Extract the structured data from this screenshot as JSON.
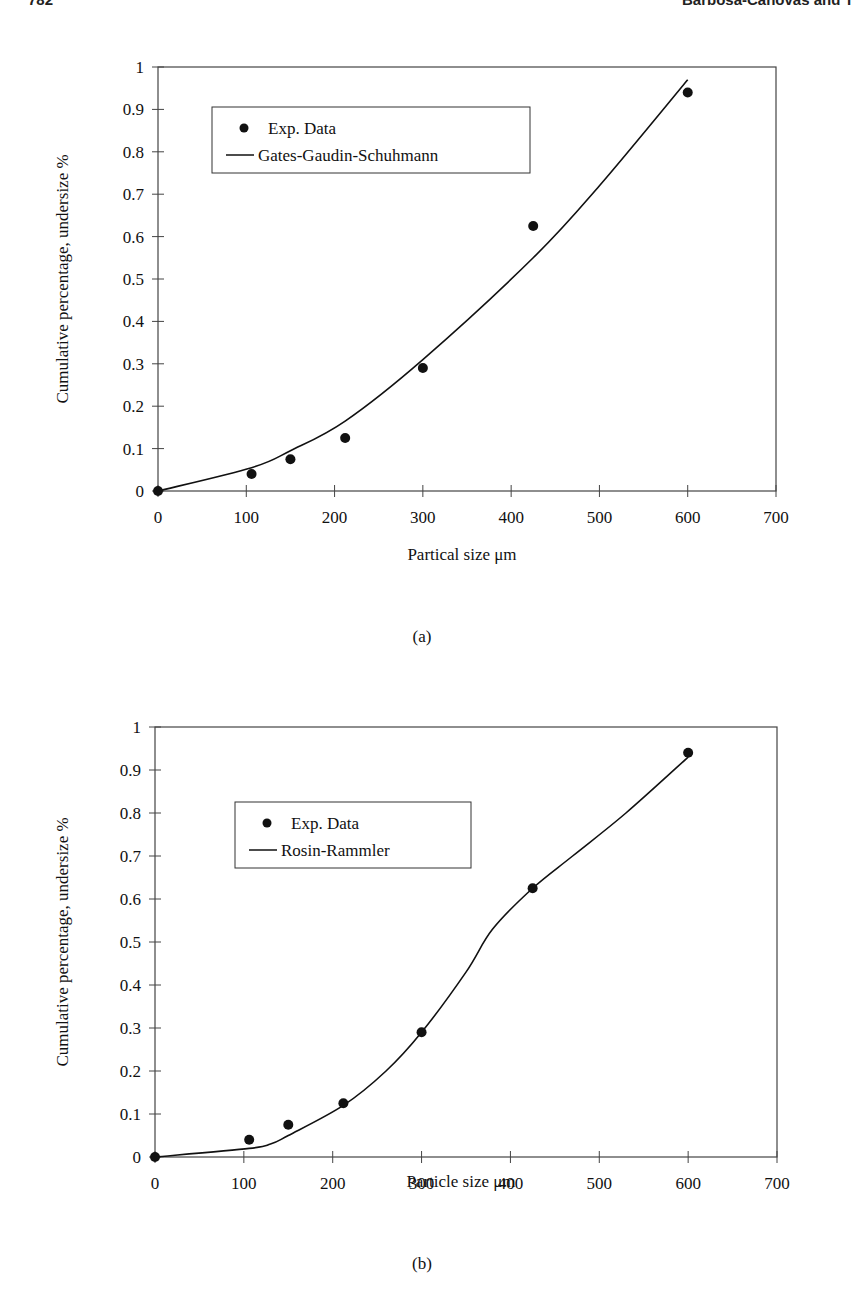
{
  "page_header": {
    "page_number": "782",
    "running_head": "Barbosa-Cánovas and T"
  },
  "figures": [
    {
      "caption": "(a)",
      "legend": {
        "marker_label": "Exp. Data",
        "line_label": "Gates-Gaudin-Schuhmann"
      },
      "xlabel": "Partical size μm",
      "ylabel": "Cumulative percentage, undersize %"
    },
    {
      "caption": "(b)",
      "legend": {
        "marker_label": "Exp. Data",
        "line_label": "Rosin-Rammler"
      },
      "xlabel": "Particle size μm",
      "ylabel": "Cumulative percentage, undersize %"
    }
  ],
  "chart_data": [
    {
      "type": "scatter",
      "title": "",
      "xlabel": "Partical size μm",
      "ylabel": "Cumulative percentage, undersize %",
      "xlim": [
        0,
        700
      ],
      "ylim": [
        0,
        1
      ],
      "x_ticks": [
        "0",
        "100",
        "200",
        "300",
        "400",
        "500",
        "600",
        "700"
      ],
      "y_ticks": [
        "0",
        "0.1",
        "0.2",
        "0.3",
        "0.4",
        "0.5",
        "0.6",
        "0.7",
        "0.8",
        "0.9",
        "1"
      ],
      "grid": false,
      "legend_position": "upper-left (inset box)",
      "series": [
        {
          "name": "Exp. Data",
          "style": "markers",
          "x": [
            0,
            106,
            150,
            212,
            300,
            425,
            600
          ],
          "y": [
            0,
            0.04,
            0.075,
            0.125,
            0.29,
            0.625,
            0.94
          ]
        },
        {
          "name": "Gates-Gaudin-Schuhmann",
          "style": "line",
          "x": [
            0,
            106,
            150,
            212,
            300,
            425,
            500,
            600
          ],
          "y": [
            0,
            0.055,
            0.095,
            0.165,
            0.31,
            0.55,
            0.72,
            0.97
          ]
        }
      ],
      "caption": "(a)"
    },
    {
      "type": "scatter",
      "title": "",
      "xlabel": "Particle size μm",
      "ylabel": "Cumulative percentage, undersize %",
      "xlim": [
        0,
        700
      ],
      "ylim": [
        0,
        1
      ],
      "x_ticks": [
        "0",
        "100",
        "200",
        "300",
        "400",
        "500",
        "600",
        "700"
      ],
      "y_ticks": [
        "0",
        "0.1",
        "0.2",
        "0.3",
        "0.4",
        "0.5",
        "0.6",
        "0.7",
        "0.8",
        "0.9",
        "1"
      ],
      "grid": false,
      "legend_position": "upper-left (inset box)",
      "series": [
        {
          "name": "Exp. Data",
          "style": "markers",
          "x": [
            0,
            106,
            150,
            212,
            300,
            425,
            600
          ],
          "y": [
            0,
            0.04,
            0.075,
            0.125,
            0.29,
            0.625,
            0.94
          ]
        },
        {
          "name": "Rosin-Rammler",
          "style": "line",
          "x": [
            0,
            106,
            130,
            150,
            212,
            260,
            300,
            350,
            380,
            425,
            470,
            530,
            600
          ],
          "y": [
            0,
            0.02,
            0.03,
            0.05,
            0.12,
            0.2,
            0.29,
            0.43,
            0.53,
            0.625,
            0.7,
            0.8,
            0.93
          ]
        }
      ],
      "caption": "(b)"
    }
  ]
}
